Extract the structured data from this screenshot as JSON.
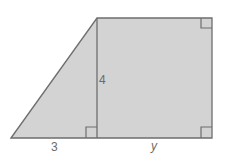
{
  "diagram": {
    "type": "geometry-trapezoid",
    "labels": {
      "height": "4",
      "triangle_base": "3",
      "rectangle_base": "y"
    },
    "colors": {
      "fill": "#d3d3d3",
      "stroke": "#6e6e6e",
      "label": "#6b6b6b"
    },
    "right_angle_markers": 3
  }
}
